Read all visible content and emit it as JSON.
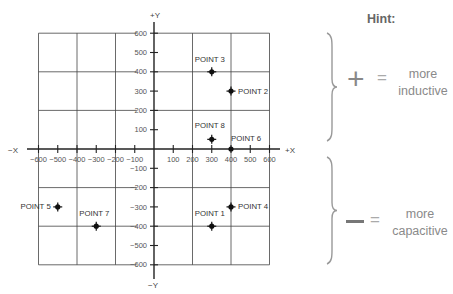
{
  "chart_data": {
    "type": "scatter",
    "title": "",
    "xlabel_pos": "+X",
    "xlabel_neg": "−X",
    "ylabel_pos": "+Y",
    "ylabel_neg": "−Y",
    "xlim": [
      -600,
      600
    ],
    "ylim": [
      -600,
      600
    ],
    "x_ticks": [
      -600,
      -500,
      -400,
      -300,
      -200,
      -100,
      100,
      200,
      300,
      400,
      500,
      600
    ],
    "y_ticks": [
      600,
      500,
      400,
      300,
      200,
      100,
      -100,
      -200,
      -300,
      -400,
      -500,
      -600
    ],
    "x_tick_labels": [
      "−600",
      "−500",
      "−400",
      "−300",
      "−200",
      "−100",
      "100",
      "200",
      "300",
      "400",
      "500",
      "600"
    ],
    "y_tick_labels": [
      "600",
      "500",
      "400",
      "300",
      "200",
      "100",
      "−100",
      "−200",
      "−300",
      "−400",
      "−500",
      "−600"
    ],
    "grid": true,
    "grid_step": 200,
    "points": [
      {
        "label": "POINT 1",
        "x": 300,
        "y": -400
      },
      {
        "label": "POINT 2",
        "x": 400,
        "y": 300
      },
      {
        "label": "POINT 3",
        "x": 300,
        "y": 400
      },
      {
        "label": "POINT 4",
        "x": 400,
        "y": -300
      },
      {
        "label": "POINT 5",
        "x": -500,
        "y": -300
      },
      {
        "label": "POINT 6",
        "x": 400,
        "y": 0
      },
      {
        "label": "POINT 7",
        "x": -300,
        "y": -400
      },
      {
        "label": "POINT 8",
        "x": 300,
        "y": 50
      }
    ]
  },
  "hint": {
    "title": "Hint:",
    "positive_symbol": "+",
    "positive_eq": "=",
    "positive_text_1": "more",
    "positive_text_2": "inductive",
    "negative_symbol": "−",
    "negative_eq": "=",
    "negative_text_1": "more",
    "negative_text_2": "capacitive"
  },
  "colors": {
    "axis": "#222222",
    "grid": "#444444",
    "point": "#111111",
    "hint_text": "#8a8a8a"
  }
}
